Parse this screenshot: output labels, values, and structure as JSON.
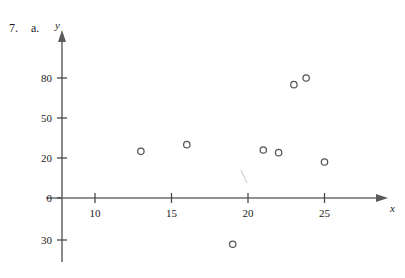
{
  "figure": {
    "problem_number": "7.",
    "part_letter": "a.",
    "x_axis_label": "x",
    "y_axis_label": "y"
  },
  "chart_data": {
    "type": "scatter",
    "title": "",
    "xlabel": "x",
    "ylabel": "y",
    "grid": false,
    "legend": null,
    "xlim": [
      7.5,
      27.5
    ],
    "ylim": [
      -40,
      95
    ],
    "xticks": [
      10,
      15,
      20,
      25
    ],
    "xtick_labels": [
      "10",
      "15",
      "20",
      "25"
    ],
    "yticks": [
      80,
      50,
      20,
      0,
      -30
    ],
    "ytick_labels": [
      "80",
      "50",
      "20",
      "0",
      "30"
    ],
    "points": [
      {
        "x": 13,
        "y": 25
      },
      {
        "x": 16,
        "y": 30
      },
      {
        "x": 19,
        "y": -33
      },
      {
        "x": 21,
        "y": 26
      },
      {
        "x": 22,
        "y": 24
      },
      {
        "x": 23,
        "y": 75
      },
      {
        "x": 23.8,
        "y": 80
      },
      {
        "x": 25,
        "y": 18
      }
    ],
    "marker": "open-circle",
    "marker_color": "#555555",
    "axis_color": "#6d6d6d"
  }
}
